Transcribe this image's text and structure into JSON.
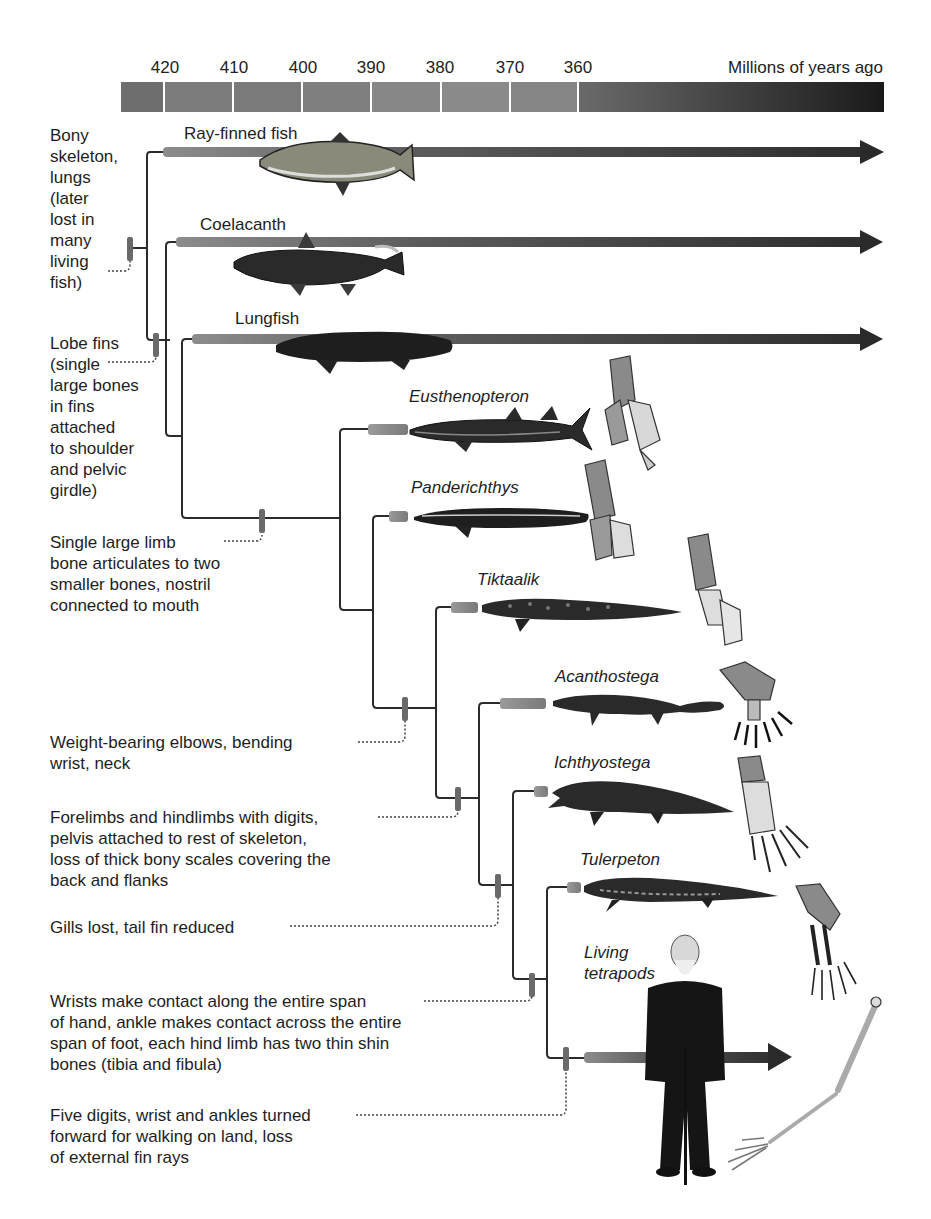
{
  "timescale": {
    "title": "Millions of years ago",
    "ticks": [
      "420",
      "410",
      "400",
      "390",
      "380",
      "370",
      "360"
    ]
  },
  "taxa": [
    {
      "name": "Ray-finned fish",
      "italic": false,
      "lineage": "living"
    },
    {
      "name": "Coelacanth",
      "italic": false,
      "lineage": "living"
    },
    {
      "name": "Lungfish",
      "italic": false,
      "lineage": "living"
    },
    {
      "name": "Eusthenopteron",
      "italic": true,
      "lineage": "extinct"
    },
    {
      "name": "Panderichthys",
      "italic": true,
      "lineage": "extinct"
    },
    {
      "name": "Tiktaalik",
      "italic": true,
      "lineage": "extinct"
    },
    {
      "name": "Acanthostega",
      "italic": true,
      "lineage": "extinct"
    },
    {
      "name": "Ichthyostega",
      "italic": true,
      "lineage": "extinct"
    },
    {
      "name": "Tulerpeton",
      "italic": true,
      "lineage": "extinct"
    },
    {
      "name": "Living\ntetrapods",
      "italic": true,
      "lineage": "living"
    }
  ],
  "traits": [
    {
      "text": "Bony\nskeleton,\nlungs\n(later\nlost in\nmany\nliving\nfish)"
    },
    {
      "text": "Lobe fins\n(single\nlarge bones\nin fins\nattached\nto shoulder\nand pelvic\ngirdle)"
    },
    {
      "text": "Single large limb\nbone articulates to two\nsmaller bones, nostril\nconnected to mouth"
    },
    {
      "text": "Weight-bearing elbows, bending\nwrist, neck"
    },
    {
      "text": "Forelimbs and hindlimbs with digits,\npelvis attached to rest of skeleton,\nloss of thick bony scales covering the\nback and flanks"
    },
    {
      "text": "Gills lost, tail fin reduced"
    },
    {
      "text": "Wrists make contact along the entire span\nof hand, ankle makes contact across the entire\nspan of foot, each hind limb has two thin shin\nbones (tibia and fibula)"
    },
    {
      "text": "Five digits, wrist and ankles turned\nforward for walking on land, loss\nof external fin rays"
    }
  ],
  "colors": {
    "branch": "#2b2b2b",
    "bar_light": "#8a8a8a",
    "bar_dark": "#333333",
    "marker": "#6a6a6a",
    "timebar_light": "#8c8c8c",
    "timebar_dark": "#1a1a1a"
  }
}
